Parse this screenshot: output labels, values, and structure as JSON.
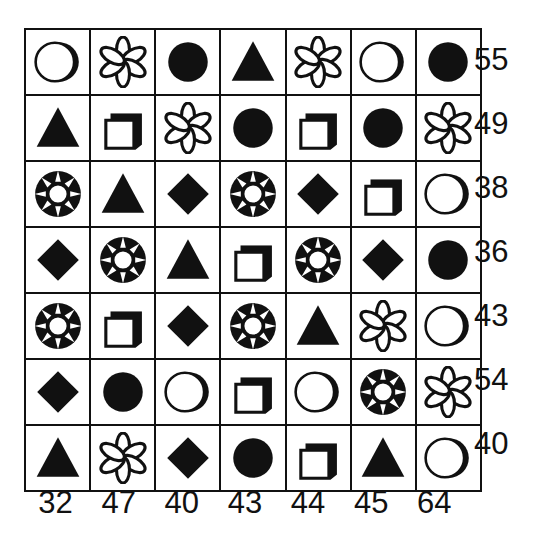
{
  "puzzle": {
    "title": "Shape Sum Grid Puzzle",
    "rows": 7,
    "cols": 7,
    "ink_color": "#111111",
    "background_color": "#ffffff",
    "shape_legend": {
      "moon-circle": "outlined circle with crescent shading on right",
      "flower": "six-petal flower / asterisk outline",
      "filled-circle": "solid black circle",
      "triangle": "solid black triangle",
      "square-3d": "white square with black 3D drop shadow",
      "gem": "black disc with white inner circle and eight white rays",
      "diamond": "solid black diamond"
    },
    "grid": [
      [
        "moon-circle",
        "flower",
        "filled-circle",
        "triangle",
        "flower",
        "moon-circle",
        "filled-circle"
      ],
      [
        "triangle",
        "square-3d",
        "flower",
        "filled-circle",
        "square-3d",
        "filled-circle",
        "flower"
      ],
      [
        "gem",
        "triangle",
        "diamond",
        "gem",
        "diamond",
        "square-3d",
        "moon-circle"
      ],
      [
        "diamond",
        "gem",
        "triangle",
        "square-3d",
        "gem",
        "diamond",
        "filled-circle"
      ],
      [
        "gem",
        "square-3d",
        "diamond",
        "gem",
        "triangle",
        "flower",
        "moon-circle"
      ],
      [
        "diamond",
        "filled-circle",
        "moon-circle",
        "square-3d",
        "moon-circle",
        "gem",
        "flower"
      ],
      [
        "triangle",
        "flower",
        "diamond",
        "filled-circle",
        "square-3d",
        "triangle",
        "moon-circle"
      ]
    ],
    "row_sums": [
      "55",
      "49",
      "38",
      "36",
      "43",
      "54",
      "40"
    ],
    "col_sums": [
      "32",
      "47",
      "40",
      "43",
      "44",
      "45",
      "64"
    ]
  },
  "chart_data": {
    "type": "table",
    "categories": [
      "col-1",
      "col-2",
      "col-3",
      "col-4",
      "col-5",
      "col-6",
      "col-7"
    ],
    "row_labels": [
      "row-1",
      "row-2",
      "row-3",
      "row-4",
      "row-5",
      "row-6",
      "row-7"
    ],
    "row_totals": [
      55,
      49,
      38,
      36,
      43,
      54,
      40
    ],
    "col_totals": [
      32,
      47,
      40,
      43,
      44,
      45,
      64
    ],
    "cells": [
      [
        "moon-circle",
        "flower",
        "filled-circle",
        "triangle",
        "flower",
        "moon-circle",
        "filled-circle"
      ],
      [
        "triangle",
        "square-3d",
        "flower",
        "filled-circle",
        "square-3d",
        "filled-circle",
        "flower"
      ],
      [
        "gem",
        "triangle",
        "diamond",
        "gem",
        "diamond",
        "square-3d",
        "moon-circle"
      ],
      [
        "diamond",
        "gem",
        "triangle",
        "square-3d",
        "gem",
        "diamond",
        "filled-circle"
      ],
      [
        "gem",
        "square-3d",
        "diamond",
        "gem",
        "triangle",
        "flower",
        "moon-circle"
      ],
      [
        "diamond",
        "filled-circle",
        "moon-circle",
        "square-3d",
        "moon-circle",
        "gem",
        "flower"
      ],
      [
        "triangle",
        "flower",
        "diamond",
        "filled-circle",
        "square-3d",
        "triangle",
        "moon-circle"
      ]
    ],
    "grid": true,
    "legend": "none"
  }
}
